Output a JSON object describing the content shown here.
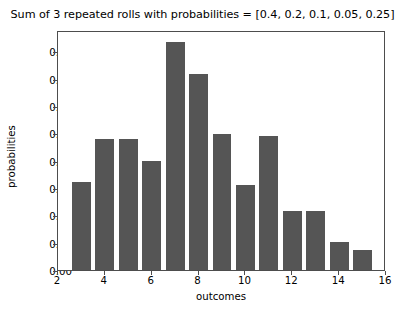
{
  "chart_data": {
    "type": "bar",
    "title": "Sum of 3 repeated rolls with probabilities = [0.4, 0.2, 0.1, 0.05, 0.25]",
    "xlabel": "outcomes",
    "ylabel": "probabilities",
    "categories": [
      3,
      4,
      5,
      6,
      7,
      8,
      9,
      10,
      11,
      12,
      13,
      14,
      15
    ],
    "values": [
      0.064,
      0.096,
      0.096,
      0.08,
      0.167,
      0.143,
      0.0995,
      0.0625,
      0.098,
      0.0435,
      0.0435,
      0.0205,
      0.0145
    ],
    "xlim": [
      2,
      16
    ],
    "ylim": [
      0.0,
      0.1755
    ],
    "xticks": [
      2,
      4,
      6,
      8,
      10,
      12,
      14,
      16
    ],
    "yticks": [
      0.0,
      0.02,
      0.04,
      0.06,
      0.08,
      0.1,
      0.12,
      0.14,
      0.16
    ],
    "ytick_labels": [
      "0.00",
      "0.02",
      "0.04",
      "0.06",
      "0.08",
      "0.10",
      "0.12",
      "0.14",
      "0.16"
    ],
    "xtick_labels": [
      "2",
      "4",
      "6",
      "8",
      "10",
      "12",
      "14",
      "16"
    ],
    "grid": false,
    "legend": null,
    "bar_color": "#555555",
    "bar_width": 0.8,
    "background_color": "#ffffff",
    "axes_color": "#4d4d4d"
  }
}
